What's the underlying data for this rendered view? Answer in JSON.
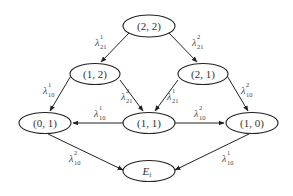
{
  "diagram": {
    "type": "state-transition-graph",
    "nodes": [
      {
        "id": "n22",
        "label": "(2, 2)",
        "cx": 149,
        "cy": 26
      },
      {
        "id": "n12",
        "label": "(1, 2)",
        "cx": 95,
        "cy": 74
      },
      {
        "id": "n21",
        "label": "(2, 1)",
        "cx": 203,
        "cy": 74
      },
      {
        "id": "n01",
        "label": "(0, 1)",
        "cx": 45,
        "cy": 123
      },
      {
        "id": "n11",
        "label": "(1, 1)",
        "cx": 149,
        "cy": 123
      },
      {
        "id": "n10",
        "label": "(1, 0)",
        "cx": 252,
        "cy": 123
      },
      {
        "id": "nEf",
        "label": "E",
        "sub": "f",
        "cx": 149,
        "cy": 171
      }
    ],
    "edges": [
      {
        "from": "(2, 2)",
        "to": "(1, 2)",
        "symbol": "λ",
        "sup": "1",
        "sub": "21"
      },
      {
        "from": "(2, 2)",
        "to": "(2, 1)",
        "symbol": "λ",
        "sup": "2",
        "sub": "21"
      },
      {
        "from": "(1, 2)",
        "to": "(0, 1)",
        "symbol": "λ",
        "sup": "1",
        "sub": "10"
      },
      {
        "from": "(1, 2)",
        "to": "(1, 1)",
        "symbol": "λ",
        "sup": "2",
        "sub": "21"
      },
      {
        "from": "(2, 1)",
        "to": "(1, 1)",
        "symbol": "λ",
        "sup": "1",
        "sub": "21"
      },
      {
        "from": "(2, 1)",
        "to": "(1, 0)",
        "symbol": "λ",
        "sup": "2",
        "sub": "10"
      },
      {
        "from": "(1, 1)",
        "to": "(0, 1)",
        "symbol": "λ",
        "sup": "1",
        "sub": "10"
      },
      {
        "from": "(1, 1)",
        "to": "(1, 0)",
        "symbol": "λ",
        "sup": "2",
        "sub": "10"
      },
      {
        "from": "(0, 1)",
        "to": "E_f",
        "symbol": "λ",
        "sup": "2",
        "sub": "10"
      },
      {
        "from": "(1, 0)",
        "to": "E_f",
        "symbol": "λ",
        "sup": "1",
        "sub": "10"
      }
    ]
  },
  "labels": {
    "e0": {
      "sym": "λ",
      "sup": "1",
      "sub": "21"
    },
    "e1": {
      "sym": "λ",
      "sup": "2",
      "sub": "21"
    },
    "e2": {
      "sym": "λ",
      "sup": "1",
      "sub": "10"
    },
    "e3": {
      "sym": "λ",
      "sup": "2",
      "sub": "21"
    },
    "e4": {
      "sym": "λ",
      "sup": "1",
      "sub": "21"
    },
    "e5": {
      "sym": "λ",
      "sup": "2",
      "sub": "10"
    },
    "e6": {
      "sym": "λ",
      "sup": "1",
      "sub": "10"
    },
    "e7": {
      "sym": "λ",
      "sup": "2",
      "sub": "10"
    },
    "e8": {
      "sym": "λ",
      "sup": "2",
      "sub": "10"
    },
    "e9": {
      "sym": "λ",
      "sup": "1",
      "sub": "10"
    }
  },
  "node_labels": {
    "n22": "(2, 2)",
    "n12": "(1, 2)",
    "n21": "(2, 1)",
    "n01": "(0, 1)",
    "n11": "(1, 1)",
    "n10": "(1, 0)",
    "nEf_main": "E",
    "nEf_sub": "f"
  }
}
